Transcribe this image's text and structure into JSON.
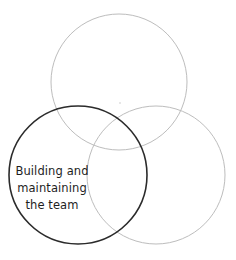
{
  "diagram": {
    "type": "venn",
    "circles": [
      {
        "id": "top",
        "cx": 119,
        "cy": 82,
        "r": 68,
        "stroke": "#bdbdbd",
        "stroke_width": 1,
        "highlighted": false,
        "label_lines": []
      },
      {
        "id": "bottom-left",
        "cx": 78,
        "cy": 175,
        "r": 69,
        "stroke": "#2b2b2b",
        "stroke_width": 1.6,
        "highlighted": true,
        "label_lines": [
          "Building and",
          "maintaining",
          "the team"
        ]
      },
      {
        "id": "bottom-right",
        "cx": 156,
        "cy": 175,
        "r": 69,
        "stroke": "#bdbdbd",
        "stroke_width": 1,
        "highlighted": false,
        "label_lines": []
      }
    ],
    "center_dot": {
      "cx": 120,
      "cy": 103,
      "color": "#c8c8c8"
    }
  },
  "label": {
    "line1": "Building and",
    "line2": "maintaining",
    "line3": "the team"
  }
}
